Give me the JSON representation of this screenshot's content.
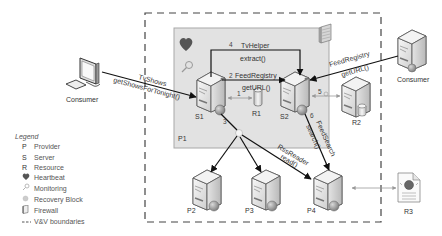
{
  "diagram": {
    "colors": {
      "provider_fill": "#e2e2e2",
      "provider_border": "#a8a8a8",
      "boundary": "#444444",
      "arrow": "#111111",
      "resource_arrow": "#999999",
      "heart": "#555555"
    },
    "boundary_label": "V&V boundaries",
    "provider_box": {
      "label": "P1"
    },
    "nodes": {
      "consumer_left": {
        "label": "Consumer",
        "icon": "desktop-computer-icon"
      },
      "consumer_right": {
        "label": "Consumer",
        "icon": "server-icon"
      },
      "s1": {
        "label": "S1",
        "icon": "server-icon"
      },
      "s2": {
        "label": "S2",
        "icon": "server-icon"
      },
      "r1": {
        "label": "R1",
        "icon": "database-icon"
      },
      "r2": {
        "label": "R2",
        "icon": "server-database-icon"
      },
      "r3": {
        "label": "R3",
        "icon": "web-document-icon"
      },
      "p2": {
        "label": "P2",
        "icon": "server-icon"
      },
      "p3": {
        "label": "P3",
        "icon": "server-icon"
      },
      "p4": {
        "label": "P4",
        "icon": "server-icon"
      }
    },
    "edges": [
      {
        "from": "consumer_left",
        "to": "s1",
        "line1": "TvShows",
        "line2": "getShowsForTonight()"
      },
      {
        "from": "s1",
        "to": "r1",
        "step": "1"
      },
      {
        "from": "s1",
        "to": "s2",
        "step": "2",
        "line1": "FeedRegistry",
        "line2": "getURL()"
      },
      {
        "from": "s1",
        "to": "p2/p3/p4",
        "step": "3"
      },
      {
        "from": "s1",
        "to": "s2",
        "step": "4",
        "line1": "TvHelper",
        "line2": "extract()"
      },
      {
        "from": "s2",
        "to": "r2",
        "step": "5"
      },
      {
        "from": "s2",
        "to": "p4",
        "step": "6",
        "line1": "FeedSearch",
        "line2": "search()"
      },
      {
        "from": "consumer_right",
        "to": "s2",
        "line1": "FeedRegistry",
        "line2": "getURL()"
      },
      {
        "from": "recovery_block",
        "to": "p4",
        "line1": "RssReader",
        "line2": "read()"
      },
      {
        "from": "p4",
        "to": "r3"
      }
    ]
  },
  "legend": {
    "title": "Legend",
    "items": [
      {
        "symbol": "P",
        "label": "Provider"
      },
      {
        "symbol": "S",
        "label": "Server"
      },
      {
        "symbol": "R",
        "label": "Resource"
      },
      {
        "symbol": "heart-icon",
        "label": "Heartbeat"
      },
      {
        "symbol": "magnifier-icon",
        "label": "Monitoring"
      },
      {
        "symbol": "recovery-dot-icon",
        "label": "Recovery Block"
      },
      {
        "symbol": "firewall-icon",
        "label": "Firewall"
      },
      {
        "symbol": "dashed-line-icon",
        "label": "V&V boundaries"
      }
    ]
  }
}
